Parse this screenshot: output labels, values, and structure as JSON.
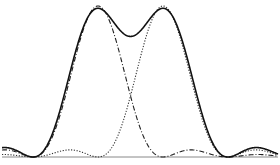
{
  "figure": {
    "colors": {
      "background": "#ffffff",
      "stroke": "#222222",
      "baseline": "#888888"
    },
    "baseline_y": 157,
    "peak_height_px": 151,
    "left_peak_x": 98,
    "right_peak_x": 163,
    "half_width_px": 65,
    "x_range": [
      2,
      278
    ]
  },
  "curves": [
    {
      "name": "left-pattern",
      "style": "dash-dot",
      "center_x": 98
    },
    {
      "name": "right-pattern",
      "style": "dotted",
      "center_x": 163
    },
    {
      "name": "sum-intensity",
      "style": "solid"
    }
  ]
}
